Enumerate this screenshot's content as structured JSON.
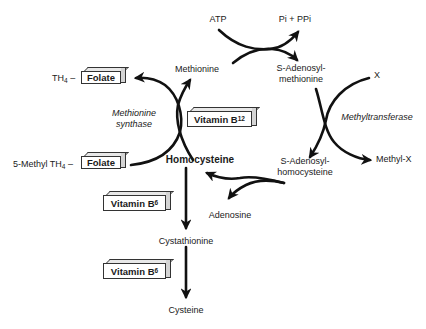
{
  "diagram": {
    "type": "metabolic-pathway",
    "nodes": {
      "atp": "ATP",
      "pi_ppi": "Pi + PPi",
      "methionine": "Methionine",
      "sam_line1": "S-Adenosyl-",
      "sam_line2": "methionine",
      "x": "X",
      "methyltransferase": "Methyltransferase",
      "methyl_x": "Methyl-X",
      "sah_line1": "S-Adenosyl-",
      "sah_line2": "homocysteine",
      "adenosine": "Adenosine",
      "homocysteine": "Homocysteine",
      "methionine_synthase_line1": "Methionine",
      "methionine_synthase_line2": "synthase",
      "th4_prefix": "TH",
      "th4_sub": "4",
      "th4_dash": " –",
      "methyl_th4_prefix": "5-Methyl TH",
      "methyl_th4_sub": "4",
      "methyl_th4_dash": " –",
      "cystathionine": "Cystathionine",
      "cysteine": "Cysteine"
    },
    "cofactor_boxes": {
      "folate_top": "Folate",
      "folate_bottom": "Folate",
      "vitamin_b12_main": "Vitamin B",
      "vitamin_b12_sub": "12",
      "vitamin_b6_upper_main": "Vitamin B",
      "vitamin_b6_upper_sub": "6",
      "vitamin_b6_lower_main": "Vitamin B",
      "vitamin_b6_lower_sub": "6"
    },
    "edges": [
      {
        "from": "Methionine",
        "to": "S-Adenosylmethionine",
        "with": "ATP",
        "releases": "Pi + PPi"
      },
      {
        "from": "S-Adenosylmethionine",
        "to": "S-Adenosylhomocysteine",
        "with": "X",
        "releases": "Methyl-X",
        "enzyme": "Methyltransferase"
      },
      {
        "from": "S-Adenosylhomocysteine",
        "to": "Homocysteine",
        "releases": "Adenosine"
      },
      {
        "from": "Homocysteine",
        "to": "Methionine",
        "enzyme": "Methionine synthase",
        "cofactor": "Vitamin B12",
        "with": "5-Methyl TH4 – Folate",
        "releases": "TH4 – Folate"
      },
      {
        "from": "Homocysteine",
        "to": "Cystathionine",
        "cofactor": "Vitamin B6"
      },
      {
        "from": "Cystathionine",
        "to": "Cysteine",
        "cofactor": "Vitamin B6"
      }
    ],
    "colors": {
      "line": "#111111",
      "text": "#1a1a1a",
      "box_top": "#e8e8e8",
      "box_side": "#d4d4d4"
    }
  }
}
